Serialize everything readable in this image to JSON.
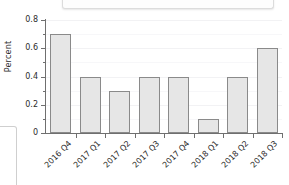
{
  "chart_data": {
    "type": "bar",
    "title": "",
    "xlabel": "",
    "ylabel": "Percent",
    "categories": [
      "2016 Q4",
      "2017 Q1",
      "2017 Q2",
      "2017 Q3",
      "2017 Q4",
      "2018 Q1",
      "2018 Q2",
      "2018 Q3"
    ],
    "values": [
      0.7,
      0.4,
      0.3,
      0.4,
      0.4,
      0.1,
      0.4,
      0.6
    ],
    "ylim": [
      0,
      0.8
    ],
    "ytick_labels": [
      "0",
      "0.2",
      "0.4",
      "0.6",
      "0.8"
    ],
    "ytick_values": [
      0,
      0.2,
      0.4,
      0.6,
      0.8
    ],
    "yminor_values": [
      0.1,
      0.3,
      0.5,
      0.7
    ],
    "grid": true,
    "legend": null,
    "bar_color": "#e6e6e6",
    "bar_border_color": "#8a8a8a",
    "axis_color": "#6f6f6f",
    "background": "#ffffff"
  },
  "overlays": {
    "top_panel_name": "cropped-top-panel",
    "left_panel_name": "cropped-left-panel"
  }
}
